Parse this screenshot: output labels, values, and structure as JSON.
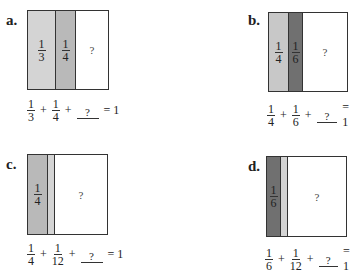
{
  "problems": [
    {
      "label": "a.",
      "segments": [
        {
          "num": "1",
          "den": "3",
          "color": "#d4d4d4"
        },
        {
          "num": "1",
          "den": "4",
          "color": "#b9b9b9"
        }
      ],
      "unknown": "?",
      "equation": {
        "t1": {
          "num": "1",
          "den": "3"
        },
        "t2": {
          "num": "1",
          "den": "4"
        },
        "plus": "+",
        "blank": "?",
        "equals": "= 1"
      }
    },
    {
      "label": "b.",
      "segments": [
        {
          "num": "1",
          "den": "4",
          "color": "#c8c8c8"
        },
        {
          "num": "1",
          "den": "6",
          "color": "#707070"
        }
      ],
      "unknown": "?",
      "equation": {
        "t1": {
          "num": "1",
          "den": "4"
        },
        "t2": {
          "num": "1",
          "den": "6"
        },
        "plus": "+",
        "blank": "?",
        "equals": "= 1"
      }
    },
    {
      "label": "c.",
      "segments": [
        {
          "num": "1",
          "den": "4",
          "color": "#b9b9b9"
        },
        {
          "num": "",
          "den": "",
          "color": "#d4d4d4"
        }
      ],
      "unknown": "?",
      "equation": {
        "t1": {
          "num": "1",
          "den": "4"
        },
        "t2": {
          "num": "1",
          "den": "12"
        },
        "plus": "+",
        "blank": "?",
        "equals": "= 1"
      }
    },
    {
      "label": "d.",
      "segments": [
        {
          "num": "1",
          "den": "6",
          "color": "#707070"
        },
        {
          "num": "",
          "den": "",
          "color": "#d4d4d4"
        }
      ],
      "unknown": "?",
      "equation": {
        "t1": {
          "num": "1",
          "den": "6"
        },
        "t2": {
          "num": "1",
          "den": "12"
        },
        "plus": "+",
        "blank": "?",
        "equals": "= 1"
      }
    }
  ]
}
